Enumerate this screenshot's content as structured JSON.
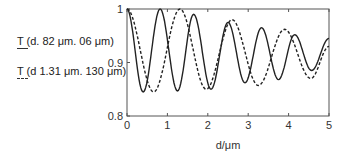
{
  "chart_data": {
    "type": "line",
    "title": "",
    "xlabel": "d/μm",
    "ylabel": "",
    "xlim": [
      0,
      5
    ],
    "ylim": [
      0.8,
      1.0
    ],
    "xticks": [
      "0",
      "1",
      "2",
      "3",
      "4",
      "5"
    ],
    "yticks": [
      "0.8",
      "0.9",
      "1"
    ],
    "grid": false,
    "legend_position": "left-outside",
    "series": [
      {
        "name": "T (d. 82 μm. 06 μm)",
        "style": "solid",
        "x": [
          0,
          0.4,
          0.82,
          1.25,
          1.65,
          2.08,
          2.5,
          2.92,
          3.33,
          3.75,
          4.15,
          4.57,
          5.0
        ],
        "values": [
          1.0,
          0.845,
          1.0,
          0.847,
          0.99,
          0.85,
          0.975,
          0.862,
          0.965,
          0.868,
          0.952,
          0.885,
          0.945
        ]
      },
      {
        "name": "T (d 1.31 μm. 130 μm)",
        "style": "dashed",
        "x": [
          0,
          0.66,
          1.31,
          1.96,
          2.6,
          3.25,
          3.9,
          4.55,
          5.0
        ],
        "values": [
          1.0,
          0.845,
          1.0,
          0.85,
          0.98,
          0.857,
          0.962,
          0.87,
          0.93
        ]
      }
    ]
  }
}
